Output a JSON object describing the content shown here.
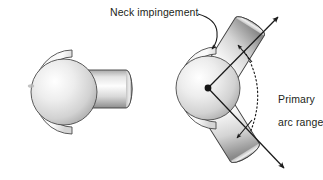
{
  "figure": {
    "background_color": "#ffffff",
    "ink_color": "#231f20"
  },
  "labels": {
    "neck_impingement": "Neck impingement",
    "primary_arc_line1": "Primary",
    "primary_arc_line2": "arc range"
  },
  "panels": [
    {
      "id": "left-panel",
      "name": "neutral-position-view",
      "components": [
        "acetabular-cup",
        "femoral-head-ball",
        "femoral-neck-stem"
      ],
      "stem_angle_deg": 0
    },
    {
      "id": "right-panel",
      "name": "arc-of-motion-view",
      "components": [
        "acetabular-cup",
        "femoral-head-ball",
        "femoral-neck-stem-upper",
        "femoral-neck-stem-lower",
        "pivot-center",
        "range-axis-upper",
        "range-axis-lower",
        "arc-indicator"
      ],
      "stem_angle_upper_deg": -58,
      "stem_angle_lower_deg": 58
    }
  ],
  "colors": {
    "outline": "#3a3a3a",
    "ball_light": "#ffffff",
    "ball_mid": "#d9d9d9",
    "ball_dark": "#9a9a9a",
    "cup_light": "#f2f2f2",
    "cup_dark": "#c9c9c9",
    "stem_light": "#fafafa",
    "stem_dark": "#8f8f8f",
    "arrow": "#1a1a1a"
  }
}
